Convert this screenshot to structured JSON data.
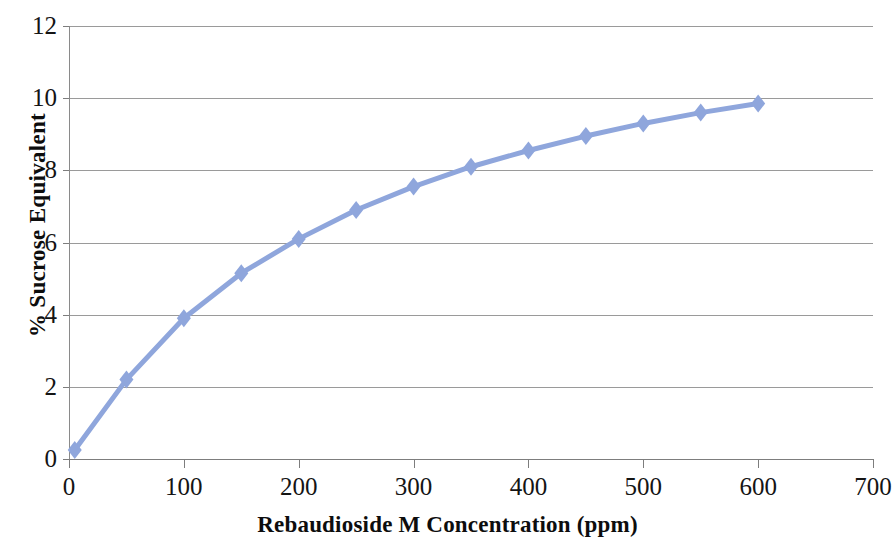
{
  "chart_data": {
    "type": "line",
    "title": "",
    "xlabel": "Rebaudioside M Concentration  (ppm)",
    "ylabel": "% Sucrose Equivalent",
    "xlim": [
      0,
      700
    ],
    "ylim": [
      0,
      12
    ],
    "xticks": [
      "0",
      "100",
      "200",
      "300",
      "400",
      "500",
      "600",
      "700"
    ],
    "xtick_values": [
      0,
      100,
      200,
      300,
      400,
      500,
      600,
      700
    ],
    "yticks": [
      "0",
      "2",
      "4",
      "6",
      "8",
      "10",
      "12"
    ],
    "ytick_values": [
      0,
      2,
      4,
      6,
      8,
      10,
      12
    ],
    "grid": true,
    "legend": "none",
    "series": [
      {
        "name": "Rebaudioside M sweetness response",
        "color": "#8FA6DC",
        "marker": "diamond",
        "x": [
          5,
          50,
          100,
          150,
          200,
          250,
          300,
          350,
          400,
          450,
          500,
          550,
          600
        ],
        "y": [
          0.25,
          2.2,
          3.9,
          5.15,
          6.1,
          6.9,
          7.55,
          8.1,
          8.55,
          8.95,
          9.3,
          9.6,
          9.85
        ]
      }
    ]
  },
  "axes": {
    "y_title": "% Sucrose Equivalent",
    "x_title": "Rebaudioside M Concentration  (ppm)"
  }
}
